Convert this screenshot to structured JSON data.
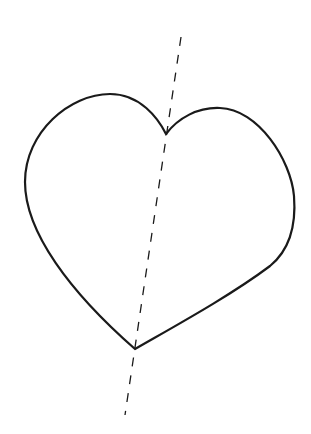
{
  "diagram": {
    "background_color": "#ffffff",
    "stroke_color": "#1a1a1a",
    "shapes": [
      {
        "type": "heart",
        "name": "heart-outline",
        "stroke_width": 2.2,
        "path": "M166,134 C158,118 140,94 110,94 C70,94 25,132 25,182 C25,232 70,292 135,349 C175,326 230,296 270,266 C292,248 296,222 294,196 C291,160 258,109 220,108 C198,107 178,118 166,134 Z"
      },
      {
        "type": "dashed-line",
        "name": "axis-line",
        "stroke_width": 1.3,
        "dash": "9,9",
        "x1": 181,
        "y1": 37,
        "x2": 125,
        "y2": 415
      }
    ]
  }
}
